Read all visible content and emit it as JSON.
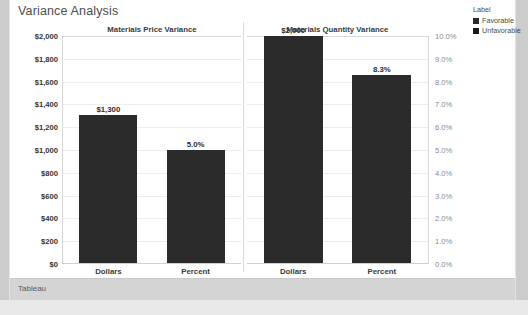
{
  "dashboard": {
    "title": "Variance Analysis",
    "footer_text": "Tableau",
    "bar_color": "#2b2b2b",
    "card_background": "#ffffff",
    "page_background": "#d2d2d2"
  },
  "legend": {
    "title": "Label",
    "items": [
      {
        "label": "Favorable",
        "color": "#2b2b2b"
      },
      {
        "label": "Unfavorable",
        "color": "#1a1a1a"
      }
    ]
  },
  "axes": {
    "left": {
      "ticks": [
        "$2,000",
        "$1,800",
        "$1,600",
        "$1,400",
        "$1,200",
        "$1,000",
        "$800",
        "$600",
        "$400",
        "$200",
        "$0"
      ]
    },
    "right": {
      "ticks": [
        "10.0%",
        "9.0%",
        "8.0%",
        "7.0%",
        "6.0%",
        "5.0%",
        "4.0%",
        "3.0%",
        "2.0%",
        "1.0%",
        "0.0%"
      ]
    }
  },
  "panels": [
    {
      "title": "Materials Price Variance",
      "bars": [
        {
          "category": "Dollars",
          "label": "$1,300",
          "value": 1300,
          "axis": "dollars",
          "pct_of_axis": 65
        },
        {
          "category": "Percent",
          "label": "5.0%",
          "value": 5.0,
          "axis": "percent",
          "pct_of_axis": 50
        }
      ]
    },
    {
      "title": "Materials Quantity Variance",
      "bars": [
        {
          "category": "Dollars",
          "label": "$2,000",
          "value": 2000,
          "axis": "dollars",
          "pct_of_axis": 100
        },
        {
          "category": "Percent",
          "label": "8.3%",
          "value": 8.3,
          "axis": "percent",
          "pct_of_axis": 83
        }
      ]
    }
  ],
  "chart_data": {
    "type": "bar",
    "title": "Variance Analysis",
    "xlabel": "",
    "ylabel": "",
    "grid": true,
    "legend_position": "top-right",
    "legend_title": "Label",
    "legend_entries": [
      "Favorable",
      "Unfavorable"
    ],
    "panels": [
      "Materials Price Variance",
      "Materials Quantity Variance"
    ],
    "categories": [
      "Dollars",
      "Percent"
    ],
    "axes": {
      "dollars": {
        "label_format": "$#,##0",
        "ylim": [
          0,
          2000
        ],
        "tick_step": 200,
        "side": "left"
      },
      "percent": {
        "label_format": "0.0%",
        "ylim": [
          0,
          10
        ],
        "tick_step": 1,
        "side": "right"
      }
    },
    "series": [
      {
        "name": "Materials Price Variance",
        "values": [
          1300,
          5.0
        ],
        "value_labels": [
          "$1,300",
          "5.0%"
        ],
        "axis": [
          "dollars",
          "percent"
        ]
      },
      {
        "name": "Materials Quantity Variance",
        "values": [
          2000,
          8.3
        ],
        "value_labels": [
          "$2,000",
          "8.3%"
        ],
        "axis": [
          "dollars",
          "percent"
        ]
      }
    ]
  }
}
